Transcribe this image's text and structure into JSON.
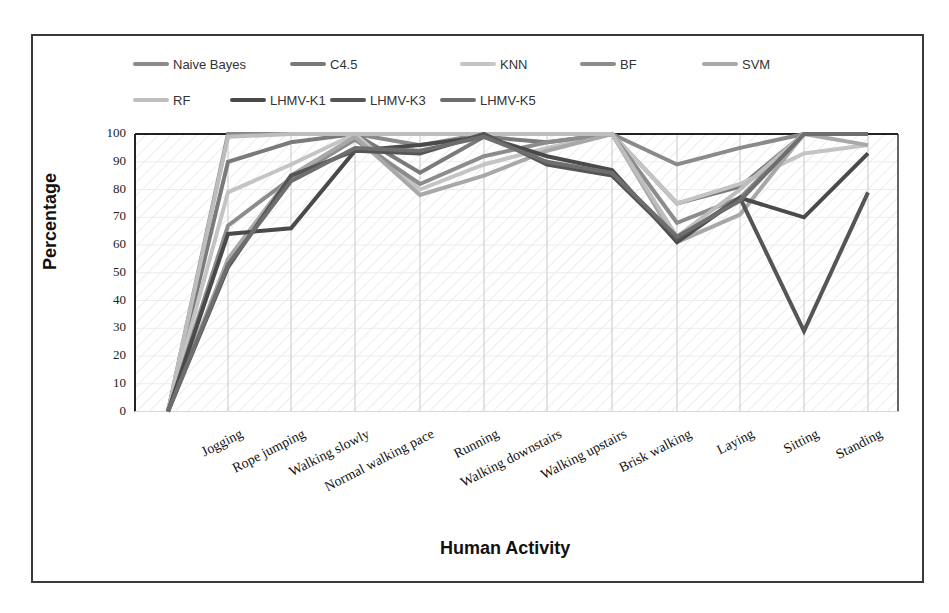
{
  "chart_data": {
    "type": "line",
    "title": "",
    "xlabel": "Human Activity",
    "ylabel": "Percentage",
    "ylim": [
      0,
      100
    ],
    "yticks": [
      0,
      10,
      20,
      30,
      40,
      50,
      60,
      70,
      80,
      90,
      100
    ],
    "grid": true,
    "legend_position": "top",
    "categories": [
      "",
      "Jogging",
      "Rope jumping",
      "Walking slowly",
      "Normal walking pace",
      "Running",
      "Walking downstairs",
      "Walking upstairs",
      "Brisk walking",
      "Laying",
      "Sitting",
      "Standing"
    ],
    "series": [
      {
        "name": "Naive Bayes",
        "color": "#8a8a8a",
        "values": [
          0,
          100,
          100,
          100,
          96,
          100,
          100,
          100,
          89,
          95,
          100,
          100
        ]
      },
      {
        "name": "C4.5",
        "color": "#7a7a7a",
        "values": [
          0,
          90,
          97,
          100,
          86,
          99,
          97,
          100,
          75,
          81,
          100,
          100
        ]
      },
      {
        "name": "KNN",
        "color": "#c4c4c4",
        "values": [
          0,
          79,
          89,
          100,
          80,
          89,
          95,
          100,
          75,
          82,
          93,
          96
        ]
      },
      {
        "name": "BF",
        "color": "#8c8c8c",
        "values": [
          0,
          67,
          84,
          98,
          82,
          92,
          97,
          100,
          68,
          77,
          100,
          100
        ]
      },
      {
        "name": "SVM",
        "color": "#a8a8a8",
        "values": [
          0,
          55,
          85,
          99,
          78,
          85,
          94,
          100,
          61,
          71,
          100,
          96
        ]
      },
      {
        "name": "RF",
        "color": "#bdbdbd",
        "values": [
          0,
          99,
          100,
          100,
          100,
          100,
          100,
          100,
          63,
          80,
          100,
          100
        ]
      },
      {
        "name": "LHMV-K1",
        "color": "#4a4a4a",
        "values": [
          0,
          64,
          66,
          94,
          96,
          99,
          92,
          87,
          61,
          77,
          70,
          93
        ]
      },
      {
        "name": "LHMV-K3",
        "color": "#555555",
        "values": [
          0,
          52,
          85,
          94,
          93,
          100,
          89,
          85,
          62,
          77,
          29,
          79
        ]
      },
      {
        "name": "LHMV-K5",
        "color": "#6e6e6e",
        "values": [
          0,
          53,
          83,
          95,
          94,
          99,
          90,
          86,
          63,
          76,
          100,
          100
        ]
      }
    ]
  },
  "labels": {
    "y_title": "Percentage",
    "x_title": "Human Activity"
  }
}
